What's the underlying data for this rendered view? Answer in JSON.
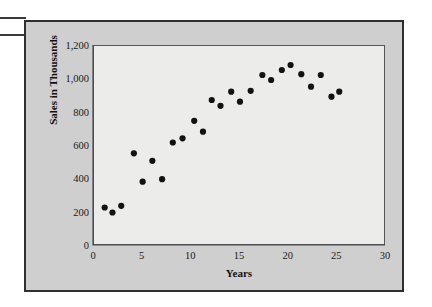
{
  "figure": {
    "background_color": "#cfcfcf",
    "panel_color": "#ececeb",
    "frame_color": "#2f2f2f",
    "point_color": "#121212"
  },
  "margin_marks": [
    {
      "name": "margin-rule-top"
    },
    {
      "name": "margin-rule-bottom"
    }
  ],
  "chart_data": {
    "type": "scatter",
    "title": "",
    "xlabel": "Years",
    "ylabel": "Sales in Thousands",
    "xlim": [
      0,
      30
    ],
    "ylim": [
      0,
      1200
    ],
    "xticks": [
      0,
      5,
      10,
      15,
      20,
      25,
      30
    ],
    "xtick_labels": [
      "0",
      "5",
      "10",
      "15",
      "20",
      "25",
      "30"
    ],
    "yticks": [
      0,
      200,
      400,
      600,
      800,
      1000,
      1200
    ],
    "ytick_labels": [
      "0",
      "200",
      "400",
      "600",
      "800",
      "1,000",
      "1,200"
    ],
    "grid": false,
    "legend": null,
    "series": [
      {
        "name": "Sales",
        "marker": "circle",
        "color": "#121212",
        "points": [
          {
            "x": 1.2,
            "y": 225
          },
          {
            "x": 2.0,
            "y": 195
          },
          {
            "x": 2.9,
            "y": 235
          },
          {
            "x": 4.2,
            "y": 550
          },
          {
            "x": 5.1,
            "y": 380
          },
          {
            "x": 6.1,
            "y": 505
          },
          {
            "x": 7.1,
            "y": 395
          },
          {
            "x": 8.2,
            "y": 615
          },
          {
            "x": 9.2,
            "y": 640
          },
          {
            "x": 10.4,
            "y": 745
          },
          {
            "x": 11.3,
            "y": 680
          },
          {
            "x": 12.2,
            "y": 870
          },
          {
            "x": 13.1,
            "y": 835
          },
          {
            "x": 14.2,
            "y": 920
          },
          {
            "x": 15.1,
            "y": 860
          },
          {
            "x": 16.2,
            "y": 925
          },
          {
            "x": 17.4,
            "y": 1020
          },
          {
            "x": 18.3,
            "y": 990
          },
          {
            "x": 19.4,
            "y": 1050
          },
          {
            "x": 20.3,
            "y": 1080
          },
          {
            "x": 21.4,
            "y": 1025
          },
          {
            "x": 22.4,
            "y": 950
          },
          {
            "x": 23.4,
            "y": 1020
          },
          {
            "x": 24.5,
            "y": 890
          },
          {
            "x": 25.3,
            "y": 920
          }
        ]
      }
    ]
  }
}
